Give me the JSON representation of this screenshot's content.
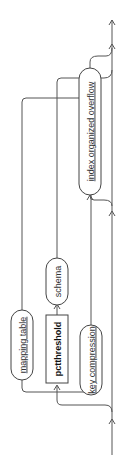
{
  "diagram": {
    "type": "railroad-syntax",
    "orientation": "rotated -90deg (flow bottom to top)",
    "nodes": [
      {
        "id": "index_organized_overflow",
        "label": "index organized overflow",
        "kind": "nonterminal"
      },
      {
        "id": "schema",
        "label": "schema",
        "kind": "nonterminal"
      },
      {
        "id": "mapping_table",
        "label": "mapping table",
        "kind": "nonterminal"
      },
      {
        "id": "pctthreshold",
        "label": "pctthreshold",
        "kind": "keyword"
      },
      {
        "id": "key_compression",
        "label": "key compression",
        "kind": "nonterminal"
      }
    ],
    "colors": {
      "line": "#555555",
      "box_border": "#444444",
      "text": "#333333"
    }
  }
}
